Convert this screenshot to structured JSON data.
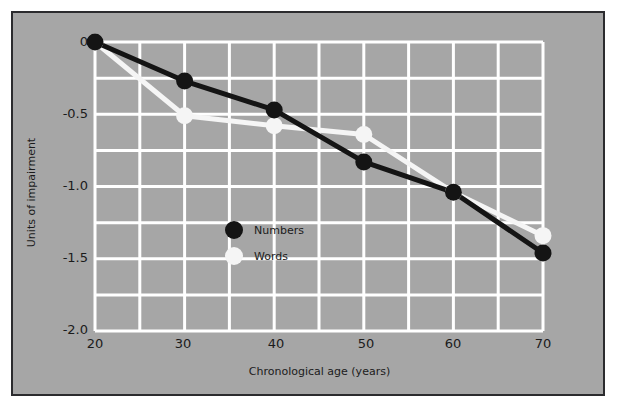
{
  "chart_data": {
    "type": "line",
    "title": "",
    "xlabel": "Chronological age (years)",
    "ylabel": "Units of impairment",
    "x": [
      20,
      30,
      40,
      50,
      60,
      70
    ],
    "xlim": [
      20,
      70
    ],
    "ylim": [
      -2.0,
      0
    ],
    "xticks": [
      "20",
      "30",
      "40",
      "50",
      "60",
      "70"
    ],
    "yticks": [
      "0",
      "-0.5",
      "-1.0",
      "-1.5",
      "-2.0"
    ],
    "ytick_values": [
      0,
      -0.5,
      -1.0,
      -1.5,
      -2.0
    ],
    "grid": true,
    "grid_color": "#ffffff",
    "grid_x_step": 5,
    "grid_y_step": 0.25,
    "background": "#a6a6a6",
    "frame_color": "#2b2b2e",
    "legend_position": "center-left-inside",
    "series": [
      {
        "name": "Numbers",
        "color": "#141414",
        "marker": "circle",
        "values": [
          0.0,
          -0.27,
          -0.47,
          -0.83,
          -1.04,
          -1.46
        ]
      },
      {
        "name": "Words",
        "color": "#f5f5f5",
        "marker": "circle",
        "values": [
          0.0,
          -0.51,
          -0.58,
          -0.64,
          -1.04,
          -1.34
        ]
      }
    ],
    "legend": [
      {
        "label": "Numbers",
        "color": "#141414"
      },
      {
        "label": "Words",
        "color": "#f5f5f5"
      }
    ]
  }
}
